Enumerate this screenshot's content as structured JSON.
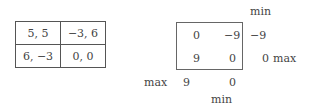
{
  "payoff_matrix": {
    "rows": [
      [
        "5, 5",
        "−3, 6"
      ],
      [
        "6, −3",
        "0, 0"
      ]
    ]
  },
  "differences_matrix": {
    "cells": [
      [
        "0",
        "−9"
      ],
      [
        "9",
        "0"
      ]
    ],
    "row_min_header": "min",
    "row_mins": [
      "−9",
      "0"
    ],
    "row_max_label": "max",
    "col_max_label": "max",
    "col_maxs": [
      "9",
      "0"
    ],
    "col_min_label": "min"
  }
}
